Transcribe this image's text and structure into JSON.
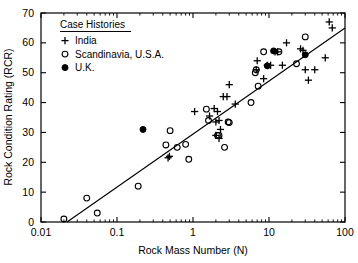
{
  "chart_data": {
    "type": "scatter",
    "title": "",
    "xlabel": "Rock Mass Number (N)",
    "ylabel": "Rock Condition Rating (RCR)",
    "xscale": "log",
    "yscale": "linear",
    "xlim": [
      0.01,
      100
    ],
    "ylim": [
      0,
      70
    ],
    "xticks": [
      "0.01",
      "0.1",
      "1",
      "10",
      "100"
    ],
    "xtick_values": [
      0.01,
      0.1,
      1,
      10,
      100
    ],
    "yticks": [
      "0",
      "10",
      "20",
      "30",
      "40",
      "50",
      "60",
      "70"
    ],
    "ytick_values": [
      0,
      10,
      20,
      30,
      40,
      50,
      60,
      70
    ],
    "grid": false,
    "legend_position": "top-left",
    "legend_title": "Case Histories",
    "series": [
      {
        "name": "India",
        "marker": "plus",
        "color": "#000000",
        "points": [
          [
            0.47,
            21.5
          ],
          [
            0.49,
            22.0
          ],
          [
            1.05,
            37.0
          ],
          [
            1.9,
            38.0
          ],
          [
            2.1,
            37.0
          ],
          [
            2.2,
            28.0
          ],
          [
            2.3,
            31.0
          ],
          [
            2.0,
            33.5
          ],
          [
            2.5,
            42.0
          ],
          [
            2.8,
            42.0
          ],
          [
            3.0,
            46.0
          ],
          [
            2.2,
            34.0
          ],
          [
            3.6,
            39.5
          ],
          [
            2.0,
            29.0
          ],
          [
            6.8,
            51.0
          ],
          [
            7.0,
            54.0
          ],
          [
            8.5,
            48.0
          ],
          [
            9.5,
            52.5
          ],
          [
            10.5,
            52.5
          ],
          [
            12.0,
            57.0
          ],
          [
            13.0,
            57.0
          ],
          [
            15.0,
            52.5
          ],
          [
            17.0,
            60.0
          ],
          [
            26.0,
            58.0
          ],
          [
            28.0,
            57.5
          ],
          [
            30.0,
            51.0
          ],
          [
            33.0,
            47.5
          ],
          [
            40.0,
            51.0
          ],
          [
            55.0,
            55.0
          ],
          [
            62.0,
            67.0
          ],
          [
            68.0,
            65.0
          ],
          [
            1.65,
            35.5
          ]
        ]
      },
      {
        "name": "Scandinavia, U.S.A.",
        "marker": "circle-open",
        "color": "#000000",
        "points": [
          [
            0.02,
            1.0
          ],
          [
            0.04,
            8.0
          ],
          [
            0.055,
            3.0
          ],
          [
            0.19,
            12.0
          ],
          [
            0.44,
            25.8
          ],
          [
            0.5,
            30.6
          ],
          [
            0.62,
            25.0
          ],
          [
            0.8,
            26.0
          ],
          [
            0.88,
            21.0
          ],
          [
            1.5,
            37.8
          ],
          [
            1.6,
            34.0
          ],
          [
            2.1,
            29.0
          ],
          [
            2.2,
            29.0
          ],
          [
            2.9,
            33.5
          ],
          [
            3.0,
            33.3
          ],
          [
            2.6,
            25.0
          ],
          [
            5.8,
            40.0
          ],
          [
            6.6,
            50.0
          ],
          [
            6.8,
            51.0
          ],
          [
            7.2,
            45.5
          ],
          [
            8.5,
            57.0
          ],
          [
            13.5,
            57.0
          ],
          [
            23.0,
            53.0
          ],
          [
            30.0,
            62.0
          ]
        ]
      },
      {
        "name": "U.K.",
        "marker": "circle-filled",
        "color": "#000000",
        "points": [
          [
            0.22,
            31.0
          ],
          [
            9.5,
            52.3
          ],
          [
            11.5,
            57.3
          ],
          [
            30.0,
            56.0
          ]
        ]
      }
    ],
    "trendline": {
      "label": "",
      "x_start": 0.022,
      "y_start": 0.0,
      "x_end": 100.0,
      "y_end": 65.0
    }
  }
}
